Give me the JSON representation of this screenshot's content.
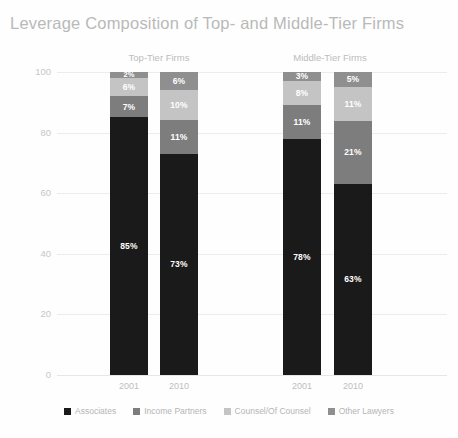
{
  "chart_data": {
    "type": "bar",
    "title": "Leverage Composition of Top- and Middle-Tier Firms",
    "xlabel": "",
    "ylabel": "",
    "ylim": [
      0,
      100
    ],
    "yticks": [
      0,
      20,
      40,
      60,
      80,
      100
    ],
    "grid": true,
    "stacked": true,
    "stack_order_bottom_to_top": [
      "Associates",
      "Income Partners",
      "Counsel/Of Counsel",
      "Other Lawyers"
    ],
    "legend_position": "bottom",
    "groups": [
      {
        "label": "Top-Tier Firms",
        "categories": [
          "2001",
          "2010"
        ]
      },
      {
        "label": "Middle-Tier Firms",
        "categories": [
          "2001",
          "2010"
        ]
      }
    ],
    "categories": [
      "2001",
      "2010",
      "2001",
      "2010"
    ],
    "series": [
      {
        "name": "Associates",
        "color": "#1a1a1a",
        "values": [
          85,
          73,
          78,
          63
        ]
      },
      {
        "name": "Income Partners",
        "color": "#7d7d7d",
        "values": [
          7,
          11,
          11,
          21
        ]
      },
      {
        "name": "Counsel/Of Counsel",
        "color": "#c4c4c4",
        "values": [
          6,
          10,
          8,
          11
        ]
      },
      {
        "name": "Other Lawyers",
        "color": "#8f8f8f",
        "values": [
          2,
          6,
          3,
          5
        ]
      }
    ],
    "data_labels": [
      [
        "85%",
        "7%",
        "6%",
        "2%"
      ],
      [
        "73%",
        "11%",
        "10%",
        "6%"
      ],
      [
        "78%",
        "11%",
        "8%",
        "3%"
      ],
      [
        "63%",
        "21%",
        "11%",
        "5%"
      ]
    ]
  },
  "legend": {
    "items": [
      {
        "label": "Associates",
        "color": "#1a1a1a"
      },
      {
        "label": "Income Partners",
        "color": "#7d7d7d"
      },
      {
        "label": "Counsel/Of Counsel",
        "color": "#c4c4c4"
      },
      {
        "label": "Other Lawyers",
        "color": "#8f8f8f"
      }
    ]
  }
}
